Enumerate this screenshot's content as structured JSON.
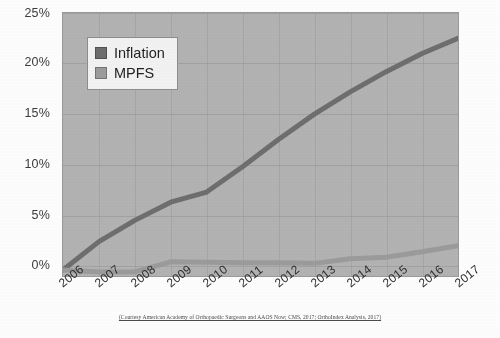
{
  "figure": {
    "caption": "(Courtesy American Academy of Orthopaedic Surgeons and AAOS Now; CMS, 2017; OrthoIndex Analysis, 2017)"
  },
  "legend": {
    "position": "top-left-inside",
    "items": [
      {
        "label": "Inflation",
        "color": "#6d6d6d",
        "icon": "legend-swatch-icon"
      },
      {
        "label": "MPFS",
        "color": "#9b9b9b",
        "icon": "legend-swatch-icon"
      }
    ]
  },
  "chart_data": {
    "type": "line",
    "title": "",
    "xlabel": "",
    "ylabel": "",
    "grid": true,
    "ylim": [
      -1,
      25
    ],
    "yticks": [
      0,
      5,
      10,
      15,
      20,
      25
    ],
    "ytick_labels": [
      "0%",
      "5%",
      "10%",
      "15%",
      "20%",
      "25%"
    ],
    "categories": [
      "2006",
      "2007",
      "2008",
      "2009",
      "2010",
      "2011",
      "2012",
      "2013",
      "2014",
      "2015",
      "2016",
      "2017"
    ],
    "series": [
      {
        "name": "Inflation",
        "color": "#6d6d6d",
        "values": [
          -0.4,
          2.4,
          4.5,
          6.3,
          7.3,
          9.8,
          12.5,
          15.0,
          17.2,
          19.2,
          21.0,
          22.5
        ]
      },
      {
        "name": "MPFS",
        "color": "#9b9b9b",
        "values": [
          -0.4,
          -0.6,
          -0.6,
          0.4,
          0.35,
          0.3,
          0.3,
          0.25,
          0.7,
          0.85,
          1.4,
          2.0
        ]
      }
    ]
  }
}
